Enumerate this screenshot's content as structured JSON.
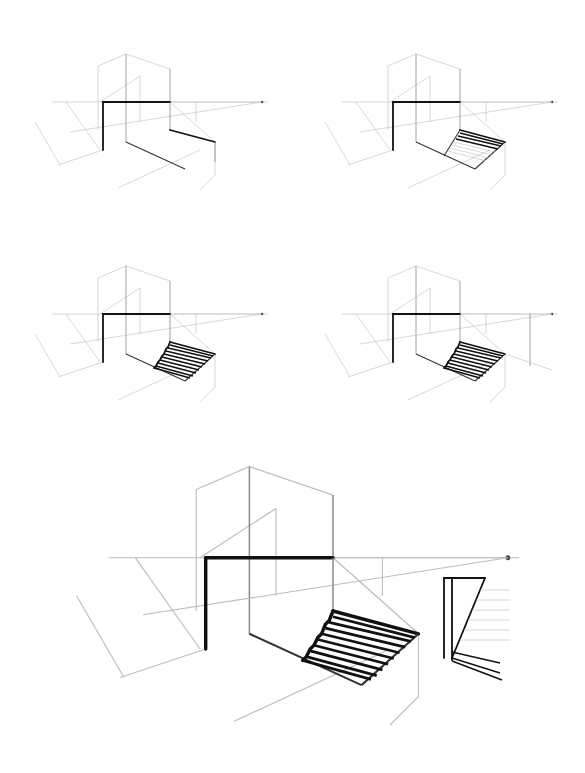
{
  "figure": {
    "title": "",
    "panels": [
      {
        "id": "step-1",
        "label": "",
        "stage": "box and ground plane guides"
      },
      {
        "id": "step-2",
        "label": "",
        "stage": "inclined plane with first treads"
      },
      {
        "id": "step-3",
        "label": "",
        "stage": "full stair treads"
      },
      {
        "id": "step-4",
        "label": "",
        "stage": "full stair treads with extra vertical guide"
      },
      {
        "id": "step-5",
        "label": "",
        "stage": "final enlarged drawing with second stair view"
      }
    ],
    "colors": {
      "background": "#ffffff",
      "ink": "#111111",
      "guide": "#bdbdbd"
    }
  }
}
